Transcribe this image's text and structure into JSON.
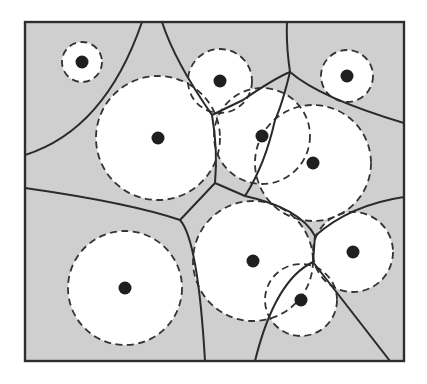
{
  "diagram": {
    "type": "power-diagram (weighted Voronoi / Laguerre diagram) with site disks",
    "background": "#ffffff",
    "cell_fill": "#cfcfcf",
    "disk_fill": "#ffffff",
    "line_color": "#2a2a2a",
    "frame": {
      "x": 25,
      "y": 22,
      "width": 379,
      "height": 339
    },
    "sites": [
      {
        "id": "s1",
        "cx": 82,
        "cy": 62,
        "r": 20
      },
      {
        "id": "s2",
        "cx": 158,
        "cy": 138,
        "r": 62
      },
      {
        "id": "s3",
        "cx": 220,
        "cy": 81,
        "r": 32
      },
      {
        "id": "s4",
        "cx": 347,
        "cy": 76,
        "r": 26
      },
      {
        "id": "s5",
        "cx": 262,
        "cy": 136,
        "r": 48
      },
      {
        "id": "s6",
        "cx": 313,
        "cy": 163,
        "r": 58
      },
      {
        "id": "s7",
        "cx": 125,
        "cy": 288,
        "r": 57
      },
      {
        "id": "s8",
        "cx": 253,
        "cy": 261,
        "r": 60
      },
      {
        "id": "s9",
        "cx": 353,
        "cy": 252,
        "r": 40
      },
      {
        "id": "s10",
        "cx": 301,
        "cy": 300,
        "r": 36
      }
    ],
    "edges": [
      "M25,155 Q105,130 142,22",
      "M162,22 Q175,62 212,115",
      "M212,115 L243,100 Q275,78 290,72",
      "M287,22 Q286,45 290,72",
      "M290,72 Q320,98 404,123",
      "M290,72 Q282,105 275,120 Q265,165 245,196",
      "M212,115 Q218,150 215,183 L245,196",
      "M25,188 Q130,203 180,220 L215,183",
      "M180,220 Q198,240 205,361",
      "M245,196 Q300,208 315,236",
      "M315,236 Q350,205 404,197",
      "M315,236 L313,262",
      "M313,262 Q275,280 255,361",
      "M313,262 L390,361"
    ]
  }
}
